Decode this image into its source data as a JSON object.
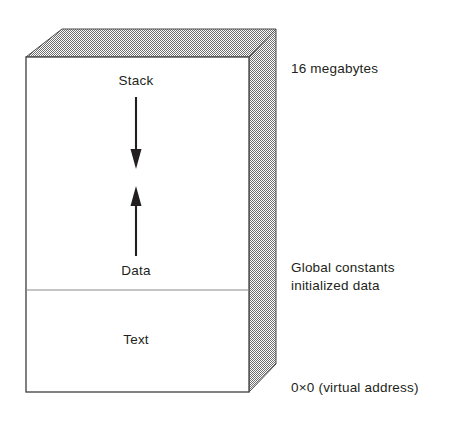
{
  "diagram": {
    "box": {
      "fill": "#ffffff",
      "shade_fill": "#9a9a9a",
      "outline": "#3a3a3a",
      "divider": "#7a7a7a"
    },
    "regions": [
      {
        "id": "stack",
        "label": "Stack"
      },
      {
        "id": "data",
        "label": "Data"
      },
      {
        "id": "text",
        "label": "Text"
      }
    ],
    "arrows": [
      {
        "id": "stack-growth",
        "direction": "down",
        "color": "#231f20"
      },
      {
        "id": "data-growth",
        "direction": "up",
        "color": "#231f20"
      }
    ],
    "annotations": [
      {
        "id": "top-address",
        "text": "16 megabytes"
      },
      {
        "id": "middle-address",
        "line1": "Global constants",
        "line2": "initialized data"
      },
      {
        "id": "base-address",
        "text": "0×0 (virtual address)"
      }
    ]
  }
}
